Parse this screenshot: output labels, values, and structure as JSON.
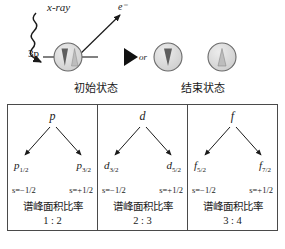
{
  "process": {
    "xray_label": "x-ray",
    "electron_label": "e⁻",
    "orbital_label": "3p",
    "or_label": "or",
    "initial_state_label": "初始状态",
    "final_state_label": "结束状态",
    "icons": {
      "xray": "wavy-photon-arrow-icon",
      "electron": "straight-arrow-icon",
      "transition": "play-triangle-icon",
      "initial_atom": "atom-circle-paired-spins-icon",
      "final_atom_down": "atom-circle-spin-down-icon",
      "final_atom_up": "atom-circle-spin-up-icon"
    }
  },
  "panels": [
    {
      "parent": "p",
      "left_child": "p",
      "left_child_sub": "1/2",
      "right_child": "p",
      "right_child_sub": "3/2",
      "spin_left": "s=−1/2",
      "spin_right": "s=+1/2",
      "ratio_label": "谱峰面积比率",
      "ratio_value": "1 : 2"
    },
    {
      "parent": "d",
      "left_child": "d",
      "left_child_sub": "3/2",
      "right_child": "d",
      "right_child_sub": "5/2",
      "spin_left": "s=−1/2",
      "spin_right": "s=+1/2",
      "ratio_label": "谱峰面积比率",
      "ratio_value": "2 : 3"
    },
    {
      "parent": "f",
      "left_child": "f",
      "left_child_sub": "5/2",
      "right_child": "f",
      "right_child_sub": "7/2",
      "spin_left": "s=−1/2",
      "spin_right": "s=+1/2",
      "ratio_label": "谱峰面积比率",
      "ratio_value": "3 : 4"
    }
  ],
  "colors": {
    "ink": "#1a1a1a",
    "panel_border": "#4a4a4a",
    "atom_fill": "#d9d9d9",
    "spin_dark": "#5a5a5a",
    "spin_light": "#b8b8b8"
  }
}
